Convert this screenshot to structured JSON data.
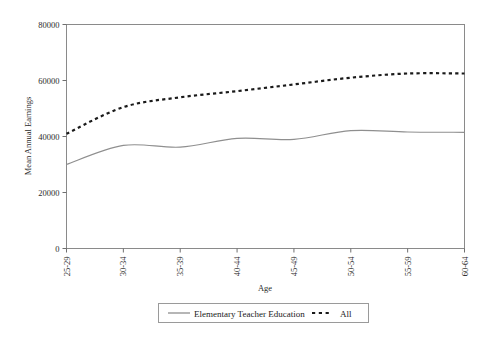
{
  "chart_data": {
    "type": "line",
    "title": "",
    "xlabel": "Age",
    "ylabel": "Mean Annual Earnings",
    "categories": [
      "25-29",
      "30-34",
      "35-39",
      "40-44",
      "45-49",
      "50-54",
      "55-59",
      "60-64"
    ],
    "ylim": [
      0,
      80000
    ],
    "y_ticks": [
      "0",
      "20000",
      "40000",
      "60000",
      "80000"
    ],
    "y_tick_values": [
      0,
      20000,
      40000,
      60000,
      80000
    ],
    "grid": false,
    "legend_position": "bottom-center",
    "series": [
      {
        "name": "Elementary Teacher Education",
        "style": "solid",
        "color": "#8f8f8f",
        "values": [
          30000,
          36800,
          36200,
          39300,
          39000,
          42100,
          41600,
          41500
        ]
      },
      {
        "name": "All",
        "style": "dotted",
        "color": "#1a1a1a",
        "values": [
          41000,
          50500,
          54000,
          56200,
          58600,
          61000,
          62500,
          62500
        ]
      }
    ]
  },
  "axes": {
    "y_title": "Mean Annual Earnings",
    "x_title": "Age"
  },
  "legend": {
    "items": [
      {
        "label": "Elementary Teacher Education",
        "marker": "solid-line-swatch"
      },
      {
        "label": "All",
        "marker": "dotted-line-swatch"
      }
    ]
  }
}
